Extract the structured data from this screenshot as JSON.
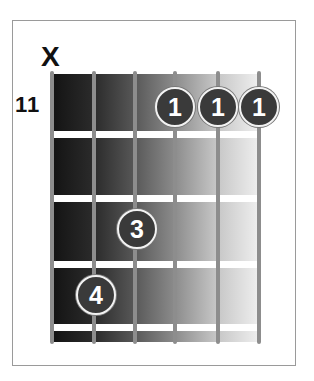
{
  "diagram": {
    "type": "guitar-chord-chart",
    "starting_fret_label": "11",
    "muted_marker": "X",
    "muted_string": 6,
    "colors": {
      "dot_fill": "#3a3a3a",
      "string": "#8d8d8d",
      "fret": "#ffffff",
      "frame": "#9a9a9a"
    },
    "strings": 6,
    "frets_shown": 4,
    "fingers": [
      {
        "label": "1",
        "string": 3,
        "fret": 1
      },
      {
        "label": "1",
        "string": 2,
        "fret": 1
      },
      {
        "label": "1",
        "string": 1,
        "fret": 1
      },
      {
        "label": "3",
        "string": 4,
        "fret": 3
      },
      {
        "label": "4",
        "string": 5,
        "fret": 4
      }
    ]
  }
}
